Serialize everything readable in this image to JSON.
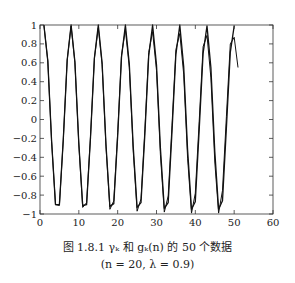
{
  "chart_data": {
    "type": "line",
    "title": "",
    "xlabel": "",
    "ylabel": "",
    "xlim": [
      0,
      60
    ],
    "ylim": [
      -1,
      1
    ],
    "xticks": [
      0,
      10,
      20,
      30,
      40,
      50,
      60
    ],
    "yticks": [
      -1,
      -0.8,
      -0.6,
      -0.4,
      -0.2,
      0,
      0.2,
      0.4,
      0.6,
      0.8,
      1
    ],
    "xtick_labels": [
      "0",
      "10",
      "20",
      "30",
      "40",
      "50",
      "60"
    ],
    "ytick_labels": [
      "−1",
      "−0.8",
      "−0.6",
      "−0.4",
      "−0.2",
      "0",
      "0.2",
      "0.4",
      "0.6",
      "0.8",
      "1"
    ],
    "grid": false,
    "legend": null,
    "series": [
      {
        "name": "γ_k",
        "x": [
          1,
          2,
          3,
          4,
          5,
          6,
          7,
          8,
          9,
          10,
          11,
          12,
          13,
          14,
          15,
          16,
          17,
          18,
          19,
          20,
          21,
          22,
          23,
          24,
          25,
          26,
          27,
          28,
          29,
          30,
          31,
          32,
          33,
          34,
          35,
          36,
          37,
          38,
          39,
          40,
          41,
          42,
          43,
          44,
          45,
          46,
          47,
          48,
          49,
          50
        ],
        "values": [
          1.0,
          0.62,
          -0.23,
          -0.9,
          -0.9,
          -0.21,
          0.63,
          1.0,
          0.61,
          -0.25,
          -0.91,
          -0.9,
          -0.19,
          0.65,
          1.0,
          0.6,
          -0.27,
          -0.92,
          -0.89,
          -0.17,
          0.66,
          1.0,
          0.59,
          -0.28,
          -0.93,
          -0.88,
          -0.15,
          0.67,
          1.0,
          0.58,
          -0.3,
          -0.94,
          -0.88,
          -0.13,
          0.69,
          1.0,
          0.56,
          -0.32,
          -0.95,
          -0.87,
          -0.11,
          0.7,
          0.99,
          0.55,
          -0.34,
          -0.95,
          -0.86,
          -0.09,
          0.71,
          0.99
        ]
      },
      {
        "name": "g_k(n)",
        "x": [
          1,
          2,
          3,
          4,
          5,
          6,
          7,
          8,
          9,
          10,
          11,
          12,
          13,
          14,
          15,
          16,
          17,
          18,
          19,
          20,
          21,
          22,
          23,
          24,
          25,
          26,
          27,
          28,
          29,
          30,
          31,
          32,
          33,
          34,
          35,
          36,
          37,
          38,
          39,
          40,
          41,
          42,
          43,
          44,
          45,
          46,
          47,
          48,
          49,
          50,
          51
        ],
        "values": [
          1.0,
          0.62,
          -0.23,
          -0.9,
          -0.91,
          -0.21,
          0.63,
          0.99,
          0.6,
          -0.26,
          -0.93,
          -0.88,
          -0.18,
          0.65,
          0.97,
          0.58,
          -0.29,
          -0.95,
          -0.86,
          -0.14,
          0.68,
          0.95,
          0.55,
          -0.33,
          -0.97,
          -0.84,
          -0.1,
          0.71,
          0.93,
          0.52,
          -0.37,
          -0.98,
          -0.81,
          -0.06,
          0.74,
          0.91,
          0.48,
          -0.41,
          -0.99,
          -0.78,
          -0.02,
          0.77,
          0.89,
          0.44,
          -0.45,
          -0.99,
          -0.75,
          0.03,
          0.8,
          0.87,
          0.55
        ]
      }
    ]
  },
  "caption": {
    "line1": "图 1.8.1   γₖ 和 gₖ(n) 的 50 个数据",
    "line2": "(n = 20, λ = 0.9)"
  }
}
